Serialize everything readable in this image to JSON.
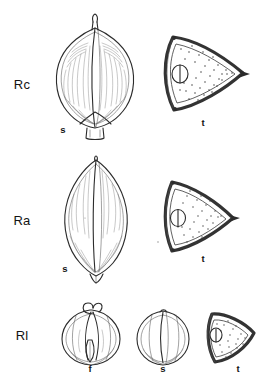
{
  "plate": {
    "background_color": "#ffffff",
    "ink_color": "#2b2b2b",
    "width": 276,
    "height": 392,
    "description": "Botanical line-drawing plate of seeds and transverse sections for three taxa"
  },
  "rows": [
    {
      "id": "row-rc",
      "label": "Rc",
      "label_x": 22,
      "label_y": 89,
      "figures": [
        {
          "id": "rc-seed",
          "kind": "seed-lateral",
          "sublabel": "s",
          "sublabel_x": 63,
          "sublabel_y": 133,
          "shape": "broadly ovoid, apex beaked, striate"
        },
        {
          "id": "rc-section",
          "kind": "transverse-section",
          "sublabel": "t",
          "sublabel_x": 203,
          "sublabel_y": 126,
          "shape": "broad triangular, thick rind, stippled endosperm, lateral embryo cavity"
        }
      ]
    },
    {
      "id": "row-ra",
      "label": "Ra",
      "label_x": 22,
      "label_y": 225,
      "figures": [
        {
          "id": "ra-seed",
          "kind": "seed-lateral",
          "sublabel": "s",
          "sublabel_x": 65,
          "sublabel_y": 272,
          "shape": "narrowly ovoid, both ends acute, faintly striate"
        },
        {
          "id": "ra-section",
          "kind": "transverse-section",
          "sublabel": "t",
          "sublabel_x": 203,
          "sublabel_y": 262,
          "shape": "narrow triangular, thick rind, stippled endosperm, lateral embryo cavity"
        }
      ]
    },
    {
      "id": "row-rl",
      "label": "Rl",
      "label_x": 22,
      "label_y": 340,
      "figures": [
        {
          "id": "rl-fruit",
          "kind": "fruit",
          "sublabel": "f",
          "sublabel_x": 90,
          "sublabel_y": 372,
          "shape": "subglobose fruit, valvate, apiculate apex"
        },
        {
          "id": "rl-seed",
          "kind": "seed-lateral",
          "sublabel": "s",
          "sublabel_x": 163,
          "sublabel_y": 372,
          "shape": "subglobose seed, longitudinally lined"
        },
        {
          "id": "rl-section",
          "kind": "transverse-section",
          "sublabel": "t",
          "sublabel_x": 238,
          "sublabel_y": 372,
          "shape": "small rounded-triangular, thick rind, stippled endosperm, lateral embryo cavity"
        }
      ]
    }
  ]
}
